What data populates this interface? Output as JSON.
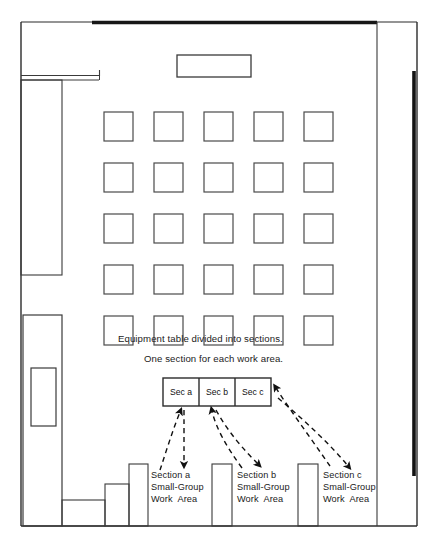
{
  "diagram": {
    "captions": {
      "line1": "Equipment table divided into sections.",
      "line2": "One section for each work area."
    },
    "equipment_table": {
      "name": "equipment-table",
      "sections": [
        {
          "id": "sec-a",
          "label": "Sec a"
        },
        {
          "id": "sec-b",
          "label": "Sec b"
        },
        {
          "id": "sec-c",
          "label": "Sec c"
        }
      ]
    },
    "work_areas": [
      {
        "id": "area-a",
        "line1": "Section a",
        "line2": "Small-Group",
        "line3": "Work  Area"
      },
      {
        "id": "area-b",
        "line1": "Section b",
        "line2": "Small-Group",
        "line3": "Work  Area"
      },
      {
        "id": "area-c",
        "line1": "Section c",
        "line2": "Small-Group",
        "line3": "Work  Area"
      }
    ],
    "colors": {
      "ink": "#111111",
      "line": "#2b2b2b",
      "thin": "#4a4a4a",
      "paper": "#ffffff",
      "heavy": "#1a1a1a"
    },
    "desk_grid": {
      "rows": 5,
      "cols": 5,
      "desk_size": 29,
      "origin_x": 104,
      "origin_y": 112,
      "step_x": 50,
      "step_y": 51
    }
  }
}
